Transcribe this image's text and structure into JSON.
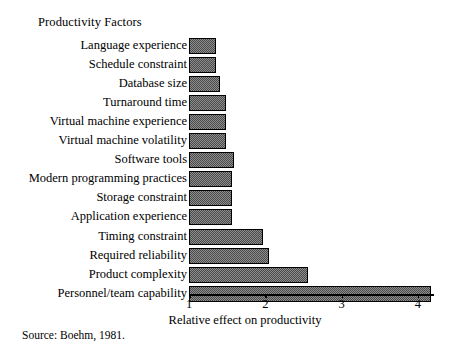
{
  "header": {
    "title": "Productivity Factors"
  },
  "source": {
    "text": "Source:  Boehm, 1981."
  },
  "chart_data": {
    "type": "bar",
    "orientation": "horizontal",
    "title": "Productivity Factors",
    "xlabel": "Relative effect on productivity",
    "ylabel": "",
    "xlim": [
      1,
      4.3
    ],
    "xticks": [
      1,
      2,
      3,
      4
    ],
    "xticklabels": [
      "1",
      "2",
      "3",
      "4"
    ],
    "grid": false,
    "legend": null,
    "source": "Source:  Boehm, 1981.",
    "categories": [
      "Language experience",
      "Schedule constraint",
      "Database size",
      "Turnaround time",
      "Virtual machine experience",
      "Virtual machine volatility",
      "Software tools",
      "Modern programming practices",
      "Storage constraint",
      "Application experience",
      "Timing constraint",
      "Required reliability",
      "Product complexity",
      "Personnel/team capability"
    ],
    "values": [
      1.35,
      1.35,
      1.4,
      1.49,
      1.49,
      1.49,
      1.59,
      1.57,
      1.57,
      1.57,
      1.97,
      2.05,
      2.56,
      4.17
    ],
    "bar_fill": "#6e6e6e",
    "bar_edge": "#000000",
    "background": "#ffffff"
  }
}
